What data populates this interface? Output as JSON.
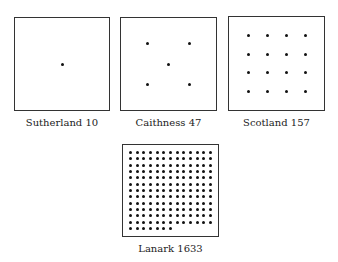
{
  "panels": [
    {
      "id": "sutherland",
      "caption": "Sutherland 10",
      "box": [
        14,
        17,
        96,
        94
      ],
      "grid": {
        "type": "points",
        "points": [
          [
            0.5,
            0.5
          ]
        ]
      }
    },
    {
      "id": "caithness",
      "caption": "Caithness 47",
      "box": [
        120,
        17,
        97,
        94
      ],
      "grid": {
        "type": "points",
        "points": [
          [
            0.28,
            0.28
          ],
          [
            0.72,
            0.28
          ],
          [
            0.5,
            0.5
          ],
          [
            0.28,
            0.72
          ],
          [
            0.72,
            0.72
          ]
        ]
      }
    },
    {
      "id": "scotland",
      "caption": "Scotland 157",
      "box": [
        228,
        16,
        97,
        95
      ],
      "grid": {
        "type": "regular",
        "cols": 4,
        "rows": 4,
        "last_row": 4,
        "margin": 0.2
      }
    },
    {
      "id": "lanark",
      "caption": "Lanark 1633",
      "box": [
        122,
        144,
        97,
        93
      ],
      "grid": {
        "type": "regular",
        "cols": 13,
        "rows": 13,
        "last_row": 7,
        "margin": 0.08
      }
    }
  ]
}
